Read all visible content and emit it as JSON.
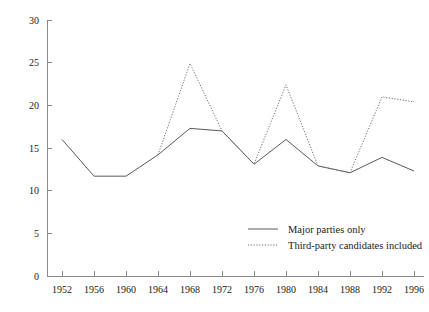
{
  "chart_data": {
    "type": "line",
    "title": "",
    "subtitle": "",
    "xlabel": "",
    "ylabel": "",
    "xlim": [
      1952,
      1996
    ],
    "ylim": [
      0,
      30
    ],
    "grid": false,
    "legend_position": "inside-bottom-right",
    "x": [
      1952,
      1956,
      1960,
      1964,
      1968,
      1972,
      1976,
      1980,
      1984,
      1988,
      1992,
      1996
    ],
    "categories": [
      "1952",
      "1956",
      "1960",
      "1964",
      "1968",
      "1972",
      "1976",
      "1980",
      "1984",
      "1988",
      "1992",
      "1996"
    ],
    "yticks": [
      0,
      5,
      10,
      15,
      20,
      25,
      30
    ],
    "ytick_labels": [
      "0",
      "5",
      "10",
      "15",
      "20",
      "25",
      "30"
    ],
    "series": [
      {
        "name": "Major parties only",
        "style": "solid",
        "color": "#5a5a5a",
        "values": [
          16.0,
          11.7,
          11.7,
          14.2,
          17.3,
          17.0,
          13.1,
          16.0,
          12.9,
          12.1,
          13.9,
          12.3
        ]
      },
      {
        "name": "Third-party candidates included",
        "style": "dotted",
        "color": "#6e6e6e",
        "values": [
          null,
          null,
          null,
          14.2,
          24.9,
          17.0,
          13.1,
          22.4,
          12.9,
          12.1,
          21.0,
          20.4
        ]
      }
    ]
  },
  "legend": {
    "items": [
      {
        "label": "Major parties only",
        "style": "solid"
      },
      {
        "label": "Third-party candidates included",
        "style": "dotted"
      }
    ]
  },
  "axes": {
    "y_axis_name": "percent-axis",
    "x_axis_name": "election-year-axis"
  }
}
